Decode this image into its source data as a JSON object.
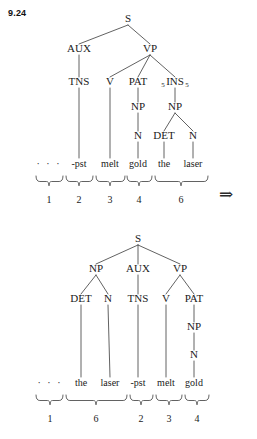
{
  "figure": {
    "label": "9.24",
    "arrow_symbol": "⇒",
    "ellipsis": "· · ·",
    "ink_color": "#1a1a1a",
    "line_color": "#3a3a3a",
    "background_color": "#ffffff"
  },
  "tree_top": {
    "root": "S",
    "nodes": [
      {
        "id": "S",
        "label": "S",
        "x": 128,
        "y": 22,
        "subscript_left": "",
        "subscript_right": ""
      },
      {
        "id": "AUX",
        "label": "AUX",
        "x": 79,
        "y": 52,
        "subscript_left": "",
        "subscript_right": ""
      },
      {
        "id": "VP",
        "label": "VP",
        "x": 150,
        "y": 52,
        "subscript_left": "",
        "subscript_right": ""
      },
      {
        "id": "TNS",
        "label": "TNS",
        "x": 79,
        "y": 85,
        "subscript_left": "",
        "subscript_right": ""
      },
      {
        "id": "V",
        "label": "V",
        "x": 110,
        "y": 85,
        "subscript_left": "",
        "subscript_right": ""
      },
      {
        "id": "PAT",
        "label": "PAT",
        "x": 138,
        "y": 85,
        "subscript_left": "",
        "subscript_right": ""
      },
      {
        "id": "INS",
        "label": "INS",
        "x": 175,
        "y": 85,
        "subscript_left": "5",
        "subscript_right": "5"
      },
      {
        "id": "NP1",
        "label": "NP",
        "x": 138,
        "y": 110,
        "subscript_left": "",
        "subscript_right": ""
      },
      {
        "id": "NP2",
        "label": "NP",
        "x": 175,
        "y": 110,
        "subscript_left": "",
        "subscript_right": ""
      },
      {
        "id": "N1",
        "label": "N",
        "x": 138,
        "y": 139,
        "subscript_left": "",
        "subscript_right": ""
      },
      {
        "id": "DET1",
        "label": "DET",
        "x": 164,
        "y": 139,
        "subscript_left": "",
        "subscript_right": ""
      },
      {
        "id": "N2",
        "label": "N",
        "x": 193,
        "y": 139,
        "subscript_left": "",
        "subscript_right": ""
      }
    ],
    "edges": [
      [
        "S",
        "AUX"
      ],
      [
        "S",
        "VP"
      ],
      [
        "AUX",
        "TNS"
      ],
      [
        "VP",
        "V"
      ],
      [
        "VP",
        "PAT"
      ],
      [
        "VP",
        "INS"
      ],
      [
        "PAT",
        "NP1"
      ],
      [
        "INS",
        "NP2"
      ],
      [
        "NP1",
        "N1"
      ],
      [
        "NP2",
        "DET1"
      ],
      [
        "NP2",
        "N2"
      ]
    ],
    "terminals": [
      {
        "word": "-pst",
        "x": 79,
        "from": "TNS"
      },
      {
        "word": "melt",
        "x": 110,
        "from": "V"
      },
      {
        "word": "gold",
        "x": 138,
        "from": "N1"
      },
      {
        "word": "the",
        "x": 164,
        "from": "DET1"
      },
      {
        "word": "laser",
        "x": 193,
        "from": "N2"
      }
    ],
    "terminal_y": 167,
    "ellipsis_x": 49,
    "brace_y": 176,
    "number_y": 203,
    "groups": [
      {
        "number": "1",
        "left": 36,
        "right": 63,
        "center": 49
      },
      {
        "number": "2",
        "left": 66,
        "right": 93,
        "center": 79
      },
      {
        "number": "3",
        "left": 96,
        "right": 125,
        "center": 110
      },
      {
        "number": "4",
        "left": 127,
        "right": 152,
        "center": 139
      },
      {
        "number": "6",
        "left": 155,
        "right": 208,
        "center": 181
      }
    ]
  },
  "tree_bottom": {
    "root": "S",
    "nodes": [
      {
        "id": "S",
        "label": "S",
        "x": 138,
        "y": 242,
        "subscript_left": "",
        "subscript_right": ""
      },
      {
        "id": "NP",
        "label": "NP",
        "x": 96,
        "y": 272,
        "subscript_left": "",
        "subscript_right": ""
      },
      {
        "id": "AUX",
        "label": "AUX",
        "x": 138,
        "y": 272,
        "subscript_left": "",
        "subscript_right": ""
      },
      {
        "id": "VP",
        "label": "VP",
        "x": 180,
        "y": 272,
        "subscript_left": "",
        "subscript_right": ""
      },
      {
        "id": "DET",
        "label": "DET",
        "x": 81,
        "y": 302,
        "subscript_left": "",
        "subscript_right": ""
      },
      {
        "id": "N1",
        "label": "N",
        "x": 108,
        "y": 302,
        "subscript_left": "",
        "subscript_right": ""
      },
      {
        "id": "TNS",
        "label": "TNS",
        "x": 138,
        "y": 302,
        "subscript_left": "",
        "subscript_right": ""
      },
      {
        "id": "V",
        "label": "V",
        "x": 166,
        "y": 302,
        "subscript_left": "",
        "subscript_right": ""
      },
      {
        "id": "PAT",
        "label": "PAT",
        "x": 194,
        "y": 302,
        "subscript_left": "",
        "subscript_right": ""
      },
      {
        "id": "NP2",
        "label": "NP",
        "x": 194,
        "y": 330,
        "subscript_left": "",
        "subscript_right": ""
      },
      {
        "id": "N2",
        "label": "N",
        "x": 194,
        "y": 358,
        "subscript_left": "",
        "subscript_right": ""
      }
    ],
    "edges": [
      [
        "S",
        "NP"
      ],
      [
        "S",
        "AUX"
      ],
      [
        "S",
        "VP"
      ],
      [
        "NP",
        "DET"
      ],
      [
        "NP",
        "N1"
      ],
      [
        "AUX",
        "TNS"
      ],
      [
        "VP",
        "V"
      ],
      [
        "VP",
        "PAT"
      ],
      [
        "PAT",
        "NP2"
      ],
      [
        "NP2",
        "N2"
      ]
    ],
    "terminals": [
      {
        "word": "the",
        "x": 81,
        "from": "DET"
      },
      {
        "word": "laser",
        "x": 110,
        "from": "N1"
      },
      {
        "word": "-pst",
        "x": 138,
        "from": "TNS"
      },
      {
        "word": "melt",
        "x": 166,
        "from": "V"
      },
      {
        "word": "gold",
        "x": 194,
        "from": "N2"
      }
    ],
    "terminal_y": 386,
    "ellipsis_x": 50,
    "brace_y": 395,
    "number_y": 422,
    "groups": [
      {
        "number": "1",
        "left": 36,
        "right": 63,
        "center": 50
      },
      {
        "number": "6",
        "left": 66,
        "right": 127,
        "center": 96
      },
      {
        "number": "2",
        "left": 130,
        "right": 153,
        "center": 141
      },
      {
        "number": "3",
        "left": 156,
        "right": 182,
        "center": 169
      },
      {
        "number": "4",
        "left": 185,
        "right": 209,
        "center": 197
      }
    ]
  }
}
